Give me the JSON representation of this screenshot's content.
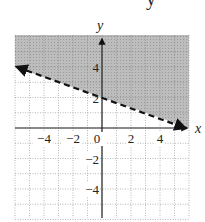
{
  "cropped_top_glyph": "y",
  "chart_data": {
    "type": "line",
    "title": "",
    "xlabel": "x",
    "ylabel": "y",
    "xlim": [
      -6,
      6
    ],
    "ylim": [
      -6,
      6
    ],
    "grid": true,
    "grid_style": "dotted",
    "x_ticks": [
      -4,
      -2,
      0,
      2,
      4
    ],
    "y_ticks": [
      -4,
      -2,
      2,
      4
    ],
    "x_tick_labels": [
      "−4",
      "−2",
      "0",
      "2",
      "4"
    ],
    "y_tick_labels": [
      "−4",
      "−2",
      "2",
      "4"
    ],
    "series": [
      {
        "name": "boundary line y = -x/3 + 2",
        "style": "dashed",
        "x": [
          -6,
          6
        ],
        "y": [
          4,
          0
        ],
        "arrows": "both"
      }
    ],
    "shaded_region": {
      "description": "region above the dashed line",
      "inequality": "y > -x/3 + 2",
      "color": "#b8b8b8"
    }
  }
}
